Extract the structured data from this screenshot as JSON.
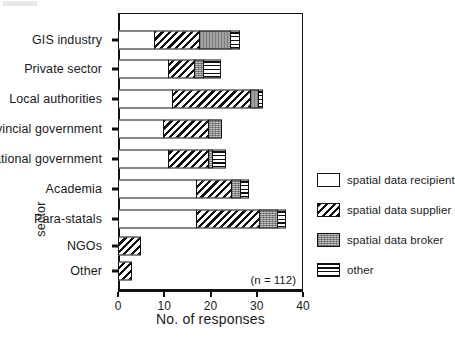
{
  "chart_data": {
    "type": "bar",
    "orientation": "horizontal",
    "stacked": true,
    "title": "",
    "xlabel": "No. of responses",
    "ylabel": "sector",
    "xlim": [
      0,
      40
    ],
    "xticks": [
      0,
      10,
      20,
      30,
      40
    ],
    "xtick_labels": [
      "0",
      "10",
      "20",
      "30",
      "40"
    ],
    "grid": false,
    "legend_position": "right",
    "annotation": "(n = 112)",
    "categories": [
      "GIS industry",
      "Private sector",
      "Local authorities",
      "Provincial government",
      "National government",
      "Academia",
      "Para-statals",
      "NGOs",
      "Other"
    ],
    "series": [
      {
        "name": "spatial data recipient",
        "key": "recipient",
        "pattern": "solid-white",
        "values": [
          8,
          11,
          12,
          10,
          11,
          17,
          17,
          0,
          0
        ]
      },
      {
        "name": "spatial data supplier",
        "key": "supplier",
        "pattern": "diagonal-hatch",
        "values": [
          10,
          6,
          17,
          10,
          9,
          8,
          14,
          5,
          3
        ]
      },
      {
        "name": "spatial data broker",
        "key": "broker",
        "pattern": "gray-stipple",
        "values": [
          7,
          2,
          2,
          3,
          1,
          2,
          4,
          0,
          0
        ]
      },
      {
        "name": "other",
        "key": "other",
        "pattern": "horizontal-hatch",
        "values": [
          2,
          4,
          1,
          0,
          3,
          2,
          2,
          0,
          0
        ]
      }
    ],
    "totals": [
      27,
      23,
      32,
      23,
      24,
      29,
      37,
      5,
      3
    ]
  },
  "legend": {
    "items": [
      {
        "label": "spatial data recipient",
        "key": "recipient"
      },
      {
        "label": "spatial data supplier",
        "key": "supplier"
      },
      {
        "label": "spatial data broker",
        "key": "broker"
      },
      {
        "label": "other",
        "key": "other"
      }
    ]
  },
  "colors": {
    "axis": "#111111",
    "recipient": "#ffffff",
    "supplier": "#ffffff",
    "broker": "#9a9a9a",
    "other": "#ffffff",
    "background": "#ffffff"
  }
}
